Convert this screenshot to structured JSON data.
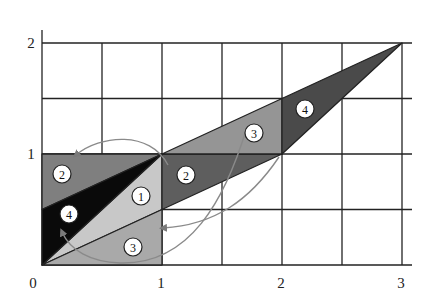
{
  "diagram": {
    "type": "geometric-transformation",
    "axes": {
      "x_ticks": [
        "0",
        "1",
        "2",
        "3"
      ],
      "y_ticks": [
        "1",
        "2"
      ],
      "x_range": [
        0,
        3
      ],
      "y_range": [
        0,
        2
      ],
      "grid_step": 0.5
    },
    "colors": {
      "region_1": "#c8c8c8",
      "region_2_left": "#7f7f7f",
      "region_3_left": "#a9a9a9",
      "region_4_left": "#0a0a0a",
      "region_2_moved": "#5e5e5e",
      "region_3_moved": "#959595",
      "region_4_moved": "#4a4a4a",
      "arrow": "#8a8a8a",
      "grid": "#222222"
    },
    "regions": [
      {
        "id": "1",
        "label": "1",
        "points": [
          [
            0,
            0
          ],
          [
            1,
            1
          ],
          [
            1,
            0.5
          ]
        ],
        "label_pos": [
          0.82,
          0.62
        ]
      },
      {
        "id": "2-left",
        "label": "2",
        "points": [
          [
            0,
            0.5
          ],
          [
            0,
            1
          ],
          [
            1,
            1
          ]
        ],
        "label_pos": [
          0.17,
          0.82
        ]
      },
      {
        "id": "3-left",
        "label": "3",
        "points": [
          [
            0,
            0
          ],
          [
            1,
            0.5
          ],
          [
            1,
            0
          ]
        ],
        "label_pos": [
          0.8,
          0.15
        ]
      },
      {
        "id": "4-left",
        "label": "4",
        "points": [
          [
            0,
            0
          ],
          [
            0,
            0.5
          ],
          [
            1,
            1
          ]
        ],
        "label_pos": [
          0.22,
          0.44
        ]
      },
      {
        "id": "2-moved",
        "label": "2",
        "points": [
          [
            1,
            0.5
          ],
          [
            1,
            1
          ],
          [
            2,
            1
          ]
        ],
        "label_pos": [
          1.2,
          0.82
        ]
      },
      {
        "id": "3-moved",
        "label": "3",
        "points": [
          [
            1,
            1
          ],
          [
            2,
            1.5
          ],
          [
            2,
            1
          ]
        ],
        "label_pos": [
          1.78,
          1.25
        ]
      },
      {
        "id": "4-moved",
        "label": "4",
        "points": [
          [
            2,
            1
          ],
          [
            2,
            1.5
          ],
          [
            3,
            2
          ]
        ],
        "label_pos": [
          2.2,
          1.5
        ]
      }
    ],
    "arrows": [
      {
        "from": "2-moved",
        "to": "2-left"
      },
      {
        "from": "3-moved",
        "to": "3-left"
      },
      {
        "from": "4-moved",
        "to": "4-left"
      }
    ]
  }
}
